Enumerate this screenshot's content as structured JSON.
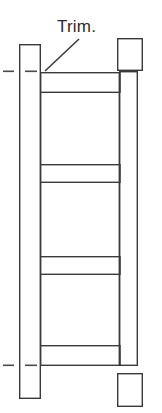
{
  "drawing": {
    "title": "Trim.",
    "type": "technical-line-drawing",
    "canvas": {
      "width": 162,
      "height": 413
    },
    "stroke_color": "#3a3a3a",
    "fill_color": "#ffffff",
    "background_color": "#ffffff",
    "stroke_width": 1.4,
    "annotations": [
      {
        "name": "trim-label",
        "text": "Trim.",
        "x": 57,
        "y": 17,
        "font_size": 17,
        "color": "#2b2b2b"
      }
    ],
    "leader_lines": [
      {
        "name": "trim-leader-line",
        "x1": 45,
        "y1": 71,
        "x2": 79,
        "y2": 39
      }
    ],
    "parts": {
      "left_stile": {
        "name": "left-stile",
        "x": 19,
        "y": 44,
        "width": 21,
        "height": 354
      },
      "right_stile": {
        "name": "right-stile",
        "x": 119,
        "y": 71,
        "width": 18,
        "height": 294
      },
      "rails": [
        {
          "name": "rail-top",
          "x": 40,
          "y": 72,
          "width": 80,
          "height": 20
        },
        {
          "name": "rail-second",
          "x": 40,
          "y": 164,
          "width": 80,
          "height": 18
        },
        {
          "name": "rail-third",
          "x": 40,
          "y": 256,
          "width": 80,
          "height": 18
        },
        {
          "name": "rail-bottom",
          "x": 40,
          "y": 345,
          "width": 80,
          "height": 20
        }
      ],
      "detached_blocks": [
        {
          "name": "block-top-right",
          "x": 117,
          "y": 38,
          "width": 25,
          "height": 32
        },
        {
          "name": "block-bottom-right",
          "x": 117,
          "y": 373,
          "width": 25,
          "height": 33
        }
      ]
    },
    "centerline_dashes": [
      {
        "name": "centerline-dash-outer-top",
        "x1": 3,
        "y1": 71,
        "x2": 14,
        "y2": 71
      },
      {
        "name": "centerline-dash-inner-top",
        "x1": 25,
        "y1": 71,
        "x2": 37,
        "y2": 71
      },
      {
        "name": "centerline-dash-outer-bottom",
        "x1": 3,
        "y1": 365,
        "x2": 14,
        "y2": 365
      },
      {
        "name": "centerline-dash-inner-bottom",
        "x1": 25,
        "y1": 365,
        "x2": 37,
        "y2": 365
      }
    ]
  }
}
